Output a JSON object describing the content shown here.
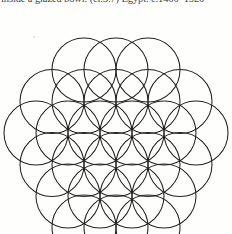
{
  "page": {
    "width": 232,
    "height": 234,
    "background_color": "#fefefd",
    "ink_color": "#232120"
  },
  "caption": {
    "text": "inside a glazed bowl. (cl.3.7) Egypt. c.1400–1520",
    "clipped": "top"
  },
  "figure": {
    "name": "flower-of-life",
    "stroke_width": 1.05,
    "stroke_color": "#232120",
    "fill": "none",
    "radius": 32,
    "column_step": 32,
    "row_step": 31.5,
    "origin": {
      "x": 116,
      "y": 133
    },
    "rows": [
      {
        "row": -2,
        "count": 3,
        "x_offset": 0,
        "cy": 70
      },
      {
        "row": -1,
        "count": 4,
        "x_offset": -16,
        "cy": 101.5
      },
      {
        "row": 0,
        "count": 5,
        "x_offset": 0,
        "cy": 133
      },
      {
        "row": 1,
        "count": 4,
        "x_offset": -16,
        "cy": 164.5
      },
      {
        "row": 2,
        "count": 5,
        "x_offset": 0,
        "cy": 196
      },
      {
        "row": 3,
        "count": 4,
        "x_offset": -16,
        "cy": 227.5
      }
    ],
    "circles": [
      {
        "cx": 84,
        "cy": 70
      },
      {
        "cx": 116,
        "cy": 70
      },
      {
        "cx": 148,
        "cy": 70
      },
      {
        "cx": 52,
        "cy": 101.5
      },
      {
        "cx": 84,
        "cy": 101.5
      },
      {
        "cx": 116,
        "cy": 101.5
      },
      {
        "cx": 148,
        "cy": 101.5
      },
      {
        "cx": 180,
        "cy": 101.5
      },
      {
        "cx": 36,
        "cy": 133
      },
      {
        "cx": 68,
        "cy": 133
      },
      {
        "cx": 100,
        "cy": 133
      },
      {
        "cx": 132,
        "cy": 133
      },
      {
        "cx": 164,
        "cy": 133
      },
      {
        "cx": 196,
        "cy": 133
      },
      {
        "cx": 52,
        "cy": 164.5
      },
      {
        "cx": 84,
        "cy": 164.5
      },
      {
        "cx": 116,
        "cy": 164.5
      },
      {
        "cx": 148,
        "cy": 164.5
      },
      {
        "cx": 180,
        "cy": 164.5
      },
      {
        "cx": 68,
        "cy": 196
      },
      {
        "cx": 100,
        "cy": 196
      },
      {
        "cx": 132,
        "cy": 196
      },
      {
        "cx": 164,
        "cy": 196
      },
      {
        "cx": 84,
        "cy": 227
      },
      {
        "cx": 116,
        "cy": 227
      },
      {
        "cx": 148,
        "cy": 227
      }
    ]
  }
}
